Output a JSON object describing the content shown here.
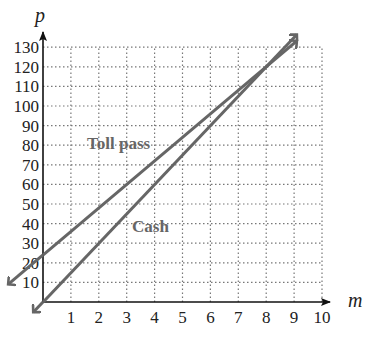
{
  "chart_data": {
    "type": "line",
    "title": "",
    "xlabel": "m",
    "ylabel": "p",
    "xlim": [
      0,
      10
    ],
    "ylim": [
      0,
      130
    ],
    "x_ticks": [
      "1",
      "2",
      "3",
      "4",
      "5",
      "6",
      "7",
      "8",
      "9",
      "10"
    ],
    "y_ticks": [
      "10",
      "20",
      "30",
      "40",
      "50",
      "60",
      "70",
      "80",
      "90",
      "100",
      "110",
      "120",
      "130"
    ],
    "grid": true,
    "grid_style": "dotted",
    "legend": "inline labels",
    "series": [
      {
        "name": "Toll pass",
        "label": "Toll pass",
        "intercept": 24,
        "slope": 12,
        "x": [
          0,
          9
        ],
        "y": [
          24,
          132
        ],
        "color": "#666666"
      },
      {
        "name": "Cash",
        "label": "Cash",
        "intercept": 0,
        "slope": 15,
        "x": [
          0,
          9
        ],
        "y": [
          0,
          135
        ],
        "color": "#666666"
      }
    ],
    "intersection": {
      "x": 8,
      "y": 120
    }
  }
}
